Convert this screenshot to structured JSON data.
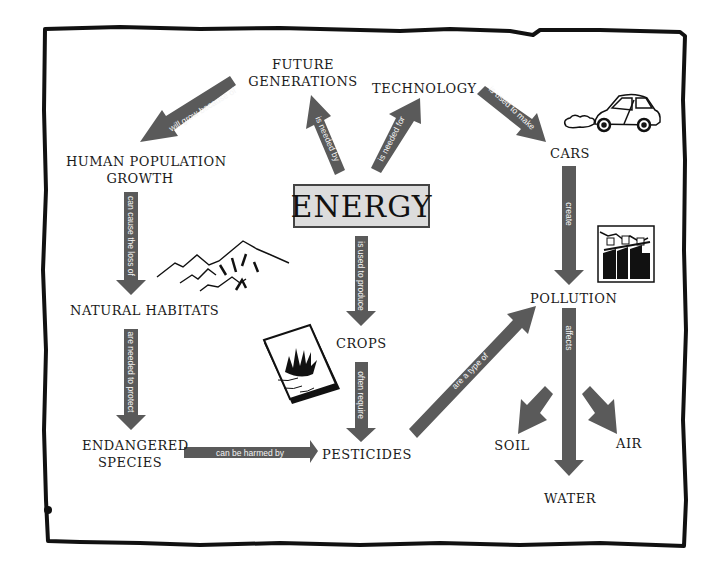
{
  "diagram": {
    "type": "concept-map",
    "central_concept": "ENERGY",
    "colors": {
      "arrow": "#5a5a5a",
      "arrow_text": "#f4f4f4",
      "border": "#111111",
      "energy_box_bg": "#dcdcdc"
    },
    "nodes": {
      "energy": "ENERGY",
      "future_generations": [
        "FUTURE",
        "GENERATIONS"
      ],
      "technology": "TECHNOLOGY",
      "human_population_growth": [
        "HUMAN POPULATION",
        "GROWTH"
      ],
      "cars": "CARS",
      "natural_habitats": "NATURAL HABITATS",
      "crops": "CROPS",
      "pollution": "POLLUTION",
      "endangered_species": [
        "ENDANGERED",
        "SPECIES"
      ],
      "pesticides": "PESTICIDES",
      "soil": "SOIL",
      "air": "AIR",
      "water": "WATER"
    },
    "edges": [
      {
        "from": "ENERGY",
        "to": "FUTURE GENERATIONS",
        "label": "is needed by"
      },
      {
        "from": "ENERGY",
        "to": "TECHNOLOGY",
        "label": "is needed for"
      },
      {
        "from": "FUTURE GENERATIONS",
        "to": "HUMAN POPULATION GROWTH",
        "label": "will grow because of"
      },
      {
        "from": "TECHNOLOGY",
        "to": "CARS",
        "label": "is used to make"
      },
      {
        "from": "HUMAN POPULATION GROWTH",
        "to": "NATURAL HABITATS",
        "label": "can cause the loss of"
      },
      {
        "from": "CARS",
        "to": "POLLUTION",
        "label": "create"
      },
      {
        "from": "ENERGY",
        "to": "CROPS",
        "label": "is used to produce"
      },
      {
        "from": "NATURAL HABITATS",
        "to": "ENDANGERED SPECIES",
        "label": "are needed to protect"
      },
      {
        "from": "CROPS",
        "to": "PESTICIDES",
        "label": "often require"
      },
      {
        "from": "ENDANGERED SPECIES",
        "to": "PESTICIDES",
        "label": "can be harmed by"
      },
      {
        "from": "PESTICIDES",
        "to": "POLLUTION",
        "label": "are a type of"
      },
      {
        "from": "POLLUTION",
        "to": "WATER",
        "label": "affects"
      },
      {
        "from": "POLLUTION",
        "to": "SOIL",
        "label": ""
      },
      {
        "from": "POLLUTION",
        "to": "AIR",
        "label": ""
      }
    ],
    "illustrations": [
      "car-illustration",
      "mountains-illustration",
      "grass-fire-card-illustration",
      "factory-smokestacks-illustration"
    ]
  }
}
